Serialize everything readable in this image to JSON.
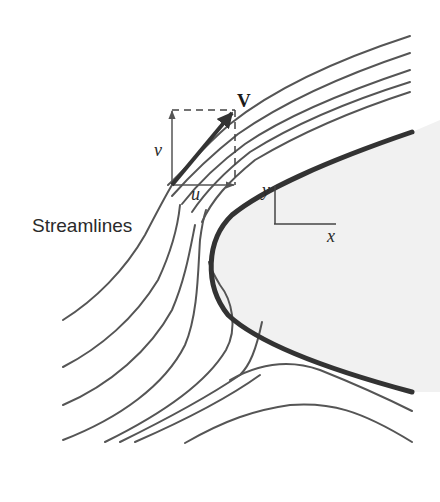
{
  "diagram": {
    "type": "streamlines-around-body",
    "labels": {
      "streamlines": "Streamlines",
      "velocity": "V",
      "u_component": "u",
      "v_component": "v",
      "x_axis": "x",
      "y_axis": "y"
    },
    "colors": {
      "streamline": "#555555",
      "body_outline": "#333333",
      "body_fill": "#f1f1f1",
      "vector": "#333333",
      "background": "#ffffff"
    }
  }
}
